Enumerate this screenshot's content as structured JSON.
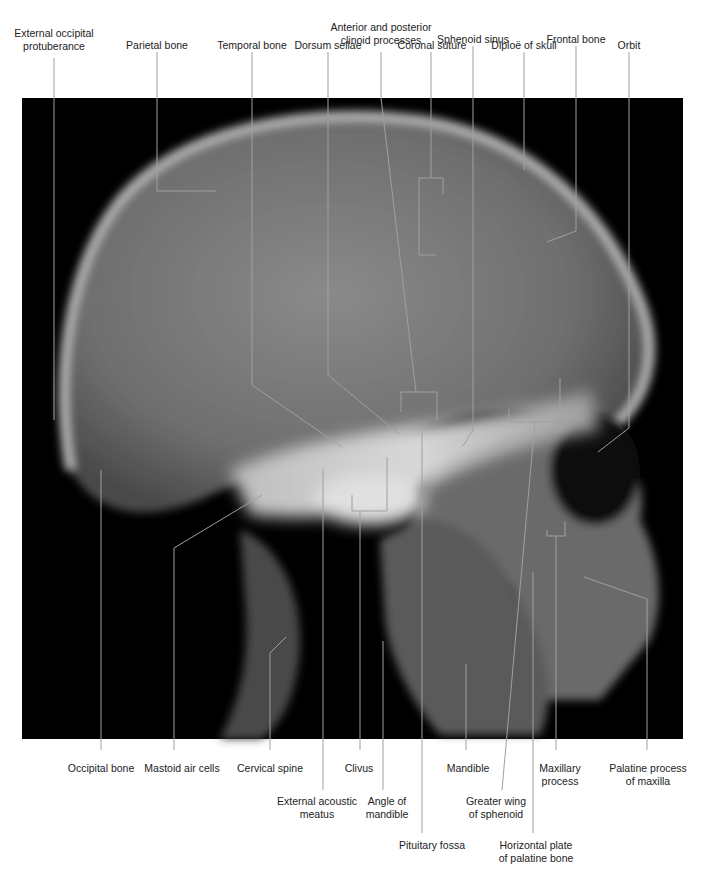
{
  "figure": {
    "type": "lateral skull radiograph",
    "background": "#000000",
    "leader_color": "#9a9a9a"
  },
  "labels_top": [
    {
      "id": "external-occipital-protuberance",
      "text": "External occipital\nprotuberance",
      "x": 54,
      "y": 27
    },
    {
      "id": "parietal-bone",
      "text": "Parietal bone",
      "x": 157,
      "y": 39
    },
    {
      "id": "temporal-bone",
      "text": "Temporal bone",
      "x": 252,
      "y": 39
    },
    {
      "id": "dorsum-sellae",
      "text": "Dorsum sellae",
      "x": 328,
      "y": 39
    },
    {
      "id": "anterior-posterior-clinoid",
      "text": "Anterior and posterior\nclinoid processes",
      "x": 381,
      "y": 22
    },
    {
      "id": "coronal-suture",
      "text": "Coronal suture",
      "x": 432,
      "y": 39
    },
    {
      "id": "sphenoid-sinus",
      "text": "Sphenoid sinus",
      "x": 473,
      "y": 33
    },
    {
      "id": "diploe-of-skull",
      "text": "Diploë of skull",
      "x": 524,
      "y": 39
    },
    {
      "id": "frontal-bone",
      "text": "Frontal bone",
      "x": 576,
      "y": 33
    },
    {
      "id": "orbit",
      "text": "Orbit",
      "x": 629,
      "y": 39
    }
  ],
  "labels_bottom": [
    {
      "id": "occipital-bone",
      "text": "Occipital bone",
      "x": 101,
      "y": 762
    },
    {
      "id": "mastoid-air-cells",
      "text": "Mastoid air cells",
      "x": 174,
      "y": 762
    },
    {
      "id": "cervical-spine",
      "text": "Cervical spine",
      "x": 270,
      "y": 762
    },
    {
      "id": "external-acoustic-meatus",
      "text": "External acoustic\nmeatus",
      "x": 318,
      "y": 795
    },
    {
      "id": "clivus",
      "text": "Clivus",
      "x": 360,
      "y": 762
    },
    {
      "id": "angle-of-mandible",
      "text": "Angle of\nmandible",
      "x": 385,
      "y": 795
    },
    {
      "id": "pituitary-fossa",
      "text": "Pituitary fossa",
      "x": 432,
      "y": 838
    },
    {
      "id": "mandible",
      "text": "Mandible",
      "x": 467,
      "y": 762
    },
    {
      "id": "greater-wing-of-sphenoid",
      "text": "Greater wing\nof sphenoid",
      "x": 496,
      "y": 795
    },
    {
      "id": "horizontal-plate-palatine",
      "text": "Horizontal plate\nof palatine bone",
      "x": 535,
      "y": 838
    },
    {
      "id": "maxillary-process",
      "text": "Maxillary\nprocess",
      "x": 560,
      "y": 762
    },
    {
      "id": "palatine-process-maxilla",
      "text": "Palatine process\nof maxilla",
      "x": 648,
      "y": 762
    }
  ]
}
